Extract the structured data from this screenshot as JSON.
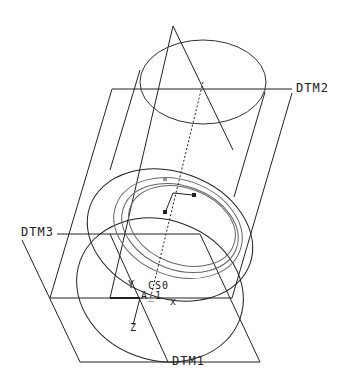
{
  "diagram": {
    "type": "cad-3d-part-view",
    "colors": {
      "line": "#222222",
      "hidden": "#777777",
      "background": "#ffffff"
    },
    "labels": {
      "dtm2": "DTM2",
      "dtm3": "DTM3",
      "dtm1": "DTM1",
      "csys": "CS0",
      "axis": "A_1",
      "x_axis": "x",
      "y_axis": "Y",
      "z_axis": "Z"
    }
  }
}
